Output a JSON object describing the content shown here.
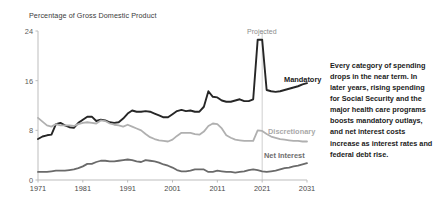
{
  "chart_data": {
    "type": "line",
    "title": "",
    "ylabel": "Percentage of Gross Domestic Product",
    "xlabel": "",
    "ylim": [
      0,
      24
    ],
    "xlim": [
      1971,
      2031
    ],
    "grid": false,
    "legend_position": "inline-labels",
    "yticks": [
      "0",
      "8",
      "16",
      "24"
    ],
    "xticks": [
      "1971",
      "1981",
      "1991",
      "2001",
      "2011",
      "2021",
      "2031"
    ],
    "annotations": [
      {
        "name": "projected-divider-label",
        "text": "Projected",
        "x": 2021
      }
    ],
    "series": [
      {
        "name": "Mandatory",
        "color": "#262626",
        "label": "Mandatory",
        "x": [
          1971,
          1972,
          1973,
          1974,
          1975,
          1976,
          1977,
          1978,
          1979,
          1980,
          1981,
          1982,
          1983,
          1984,
          1985,
          1986,
          1987,
          1988,
          1989,
          1990,
          1991,
          1992,
          1993,
          1994,
          1995,
          1996,
          1997,
          1998,
          1999,
          2000,
          2001,
          2002,
          2003,
          2004,
          2005,
          2006,
          2007,
          2008,
          2009,
          2010,
          2011,
          2012,
          2013,
          2014,
          2015,
          2016,
          2017,
          2018,
          2019,
          2020,
          2021,
          2022,
          2023,
          2024,
          2025,
          2026,
          2027,
          2028,
          2029,
          2030,
          2031
        ],
        "values": [
          6.6,
          7.0,
          7.2,
          7.3,
          9.0,
          9.2,
          8.8,
          8.5,
          8.4,
          9.2,
          9.7,
          10.2,
          10.2,
          9.5,
          9.7,
          9.6,
          9.3,
          9.2,
          9.3,
          9.9,
          10.7,
          11.2,
          11.0,
          11.0,
          11.1,
          11.0,
          10.7,
          10.4,
          10.1,
          10.1,
          10.6,
          11.1,
          11.3,
          11.1,
          11.2,
          11.0,
          11.0,
          11.8,
          14.3,
          13.4,
          13.3,
          12.8,
          12.6,
          12.6,
          12.8,
          13.0,
          12.7,
          12.7,
          13.0,
          22.6,
          22.6,
          14.5,
          14.3,
          14.2,
          14.3,
          14.5,
          14.7,
          14.9,
          15.1,
          15.4,
          15.6
        ]
      },
      {
        "name": "Discretionary",
        "color": "#b0b0b0",
        "label": "Discretionary",
        "x": [
          1971,
          1972,
          1973,
          1974,
          1975,
          1976,
          1977,
          1978,
          1979,
          1980,
          1981,
          1982,
          1983,
          1984,
          1985,
          1986,
          1987,
          1988,
          1989,
          1990,
          1991,
          1992,
          1993,
          1994,
          1995,
          1996,
          1997,
          1998,
          1999,
          2000,
          2001,
          2002,
          2003,
          2004,
          2005,
          2006,
          2007,
          2008,
          2009,
          2010,
          2011,
          2012,
          2013,
          2014,
          2015,
          2016,
          2017,
          2018,
          2019,
          2020,
          2021,
          2022,
          2023,
          2024,
          2025,
          2026,
          2027,
          2028,
          2029,
          2030,
          2031
        ],
        "values": [
          10.0,
          9.4,
          8.8,
          8.6,
          9.0,
          8.8,
          8.8,
          8.8,
          8.7,
          9.0,
          9.2,
          9.3,
          9.2,
          9.1,
          9.6,
          9.5,
          9.1,
          8.9,
          8.8,
          8.6,
          8.9,
          8.6,
          8.3,
          8.0,
          7.4,
          6.9,
          6.6,
          6.4,
          6.3,
          6.2,
          6.5,
          7.1,
          7.6,
          7.6,
          7.6,
          7.4,
          7.3,
          7.8,
          8.7,
          9.1,
          9.0,
          8.3,
          7.2,
          6.8,
          6.5,
          6.4,
          6.3,
          6.3,
          6.3,
          8.0,
          7.9,
          7.4,
          7.0,
          6.8,
          6.6,
          6.5,
          6.4,
          6.3,
          6.3,
          6.2,
          6.2
        ]
      },
      {
        "name": "Net Interest",
        "color": "#6a6a6a",
        "label": "Net Interest",
        "x": [
          1971,
          1972,
          1973,
          1974,
          1975,
          1976,
          1977,
          1978,
          1979,
          1980,
          1981,
          1982,
          1983,
          1984,
          1985,
          1986,
          1987,
          1988,
          1989,
          1990,
          1991,
          1992,
          1993,
          1994,
          1995,
          1996,
          1997,
          1998,
          1999,
          2000,
          2001,
          2002,
          2003,
          2004,
          2005,
          2006,
          2007,
          2008,
          2009,
          2010,
          2011,
          2012,
          2013,
          2014,
          2015,
          2016,
          2017,
          2018,
          2019,
          2020,
          2021,
          2022,
          2023,
          2024,
          2025,
          2026,
          2027,
          2028,
          2029,
          2030,
          2031
        ],
        "values": [
          1.3,
          1.3,
          1.3,
          1.4,
          1.5,
          1.5,
          1.5,
          1.6,
          1.7,
          1.9,
          2.2,
          2.6,
          2.6,
          2.9,
          3.1,
          3.1,
          3.0,
          3.0,
          3.1,
          3.2,
          3.3,
          3.2,
          3.0,
          2.9,
          3.2,
          3.1,
          3.0,
          2.8,
          2.5,
          2.3,
          2.0,
          1.6,
          1.4,
          1.4,
          1.5,
          1.7,
          1.7,
          1.7,
          1.3,
          1.3,
          1.5,
          1.4,
          1.3,
          1.3,
          1.2,
          1.3,
          1.4,
          1.6,
          1.7,
          1.6,
          1.4,
          1.3,
          1.4,
          1.5,
          1.7,
          1.9,
          2.0,
          2.2,
          2.3,
          2.5,
          2.7
        ]
      }
    ]
  },
  "sidenote": {
    "text": "Every category of spending drops in the near term. In later years, rising spending for Social Security and the major health care programs boosts mandatory outlays, and net interest costs increase as interest rates and federal debt rise."
  }
}
